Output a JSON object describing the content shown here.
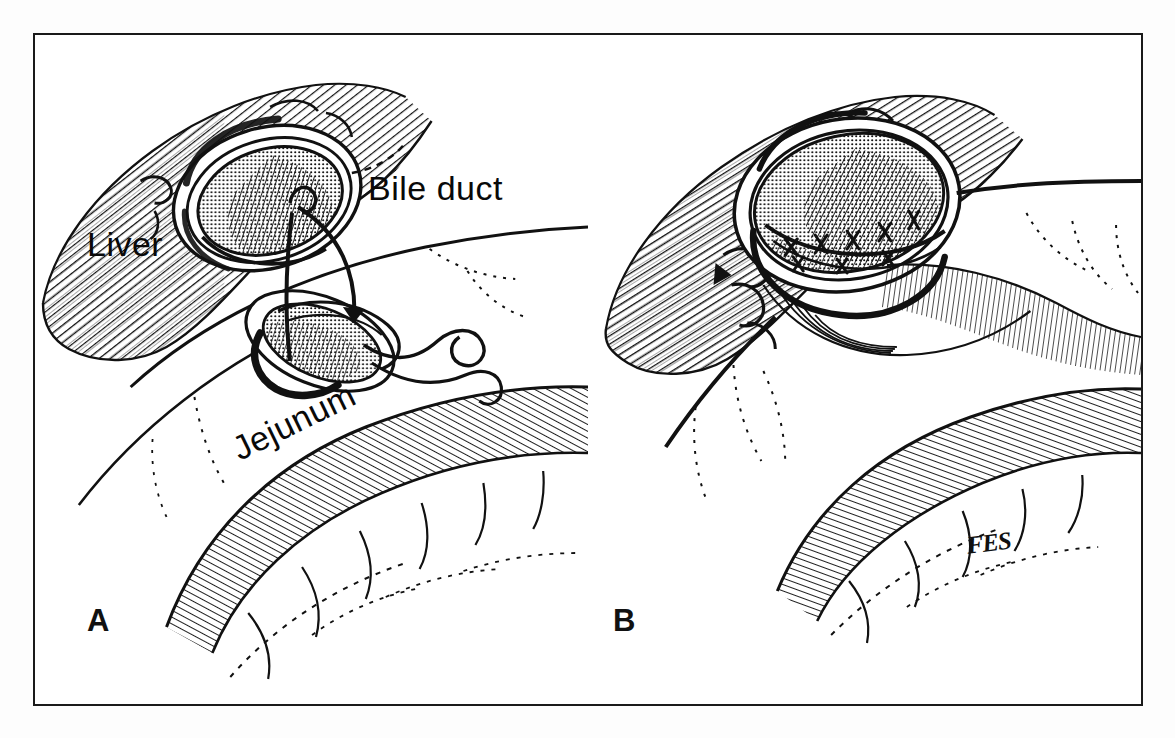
{
  "figure": {
    "style": "pen-and-ink line drawing with cross-hatching",
    "background_color": "#ffffff",
    "ink_color": "#111111",
    "frame": {
      "border_color": "#1a1a1a",
      "border_width_px": 2.5
    }
  },
  "panels": [
    {
      "letter": "A",
      "caption": "",
      "labels": [
        {
          "key": "bile_duct",
          "text": "Bile duct"
        },
        {
          "key": "liver",
          "text": "Liver"
        },
        {
          "key": "jejunum",
          "text": "Jejunum"
        }
      ],
      "depicts": "Transected bile duct stump at liver hilum with suture passed into an opening in the jejunum; free suture tails trail to the right"
    },
    {
      "letter": "B",
      "caption": "",
      "labels": [],
      "depicts": "Completed anastomosis: bile duct sutured to the jejunal opening with interrupted stitches visible on the posterior row"
    }
  ],
  "annotations": {
    "bile_duct": "Bile duct",
    "liver": "Liver",
    "jejunum": "Jejunum",
    "panel_a_letter": "A",
    "panel_b_letter": "B",
    "artist_signature": "FES"
  }
}
